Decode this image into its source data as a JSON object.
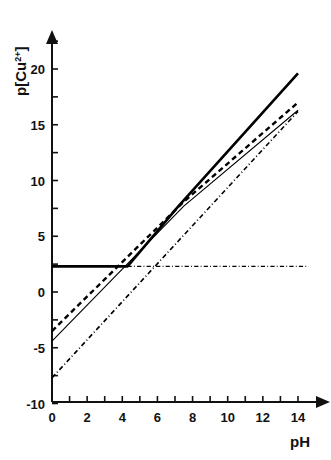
{
  "chart_data": {
    "type": "line",
    "title": "",
    "xlabel": "pH",
    "ylabel": "p[Cu 2+]",
    "ylabel_base": "p[Cu",
    "ylabel_sup": "2+",
    "ylabel_close": "]",
    "xlim": [
      0,
      14.6
    ],
    "ylim": [
      -10,
      23.5
    ],
    "xticks": [
      0,
      1,
      2,
      3,
      4,
      5,
      6,
      7,
      8,
      9,
      10,
      11,
      12,
      13,
      14
    ],
    "xtick_labels": [
      "0",
      "",
      "2",
      "",
      "4",
      "",
      "6",
      "",
      "8",
      "",
      "10",
      "",
      "12",
      "",
      "14"
    ],
    "yticks": [
      -10,
      -7.5,
      -5,
      -2.5,
      0,
      2.5,
      5,
      7.5,
      10,
      12.5,
      15,
      17.5,
      20,
      22.5
    ],
    "ytick_labels": [
      "-10",
      "",
      "-5",
      "",
      "0",
      "",
      "5",
      "",
      "10",
      "",
      "15",
      "",
      "20",
      ""
    ],
    "grid": false,
    "legend": "none",
    "axis_arrows": true,
    "series": [
      {
        "name": "thick-solid-line",
        "style": "solid",
        "width": 2.6,
        "color": "#000000",
        "x": [
          0,
          4.3,
          7.2,
          14.0
        ],
        "y": [
          2.3,
          2.3,
          7.7,
          19.6
        ]
      },
      {
        "name": "dashed-line",
        "style": "dashed",
        "width": 2.4,
        "color": "#000000",
        "x": [
          0,
          7.5,
          14.0
        ],
        "y": [
          -3.5,
          8.1,
          17.0
        ]
      },
      {
        "name": "thin-solid-line",
        "style": "solid",
        "width": 1.1,
        "color": "#000000",
        "x": [
          0,
          7.5,
          14.0
        ],
        "y": [
          -4.4,
          7.7,
          16.3
        ]
      },
      {
        "name": "dash-dot-rising-line",
        "style": "dashdot",
        "width": 1.6,
        "color": "#000000",
        "x": [
          0,
          14.0
        ],
        "y": [
          -7.7,
          16.2
        ]
      },
      {
        "name": "dash-dot-horizontal-line",
        "style": "dashdot",
        "width": 1.4,
        "color": "#000000",
        "x": [
          4.3,
          14.6
        ],
        "y": [
          2.3,
          2.3
        ]
      }
    ],
    "annotations": []
  },
  "geometry": {
    "x0_px": 52,
    "y0_px": 292,
    "px_per_x": 17.57,
    "px_per_y": 11.15,
    "x_axis_end_px": 322,
    "y_axis_top_px": 40
  }
}
